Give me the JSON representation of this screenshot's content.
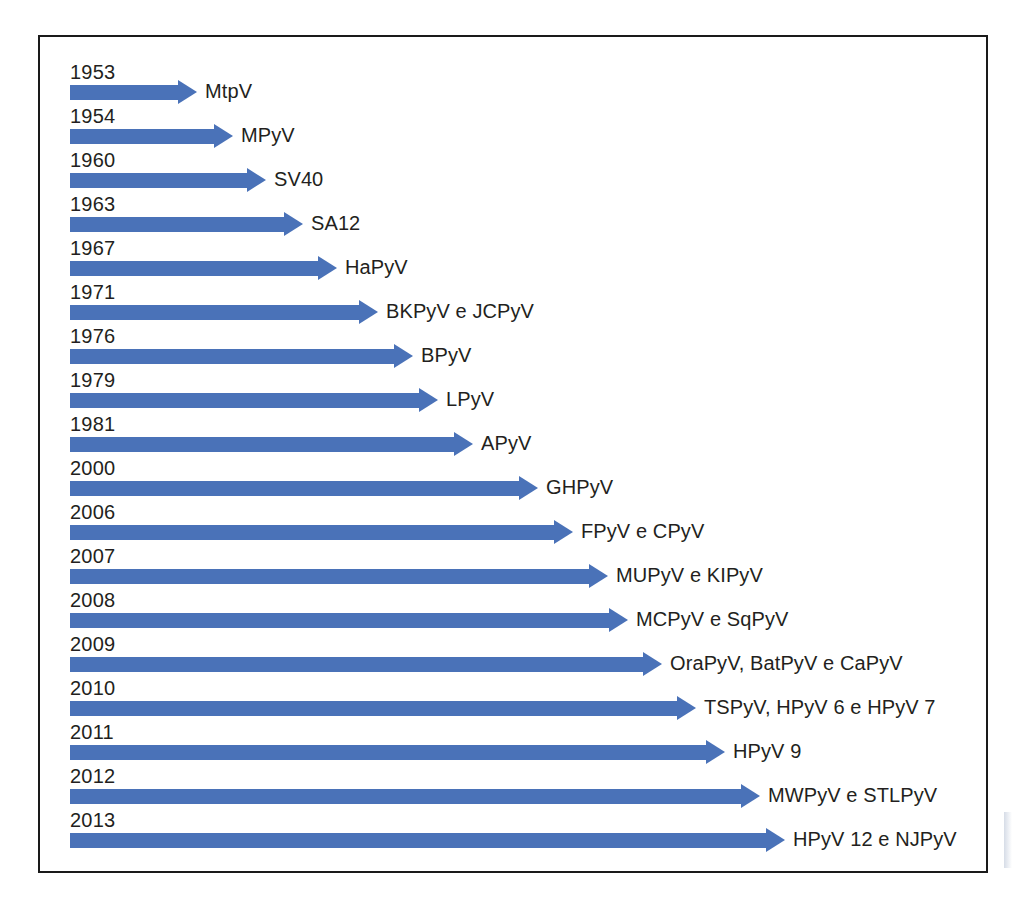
{
  "figure": {
    "kind": "timeline",
    "frame_color": "#1a1a1a",
    "arrow_color": "#4a72b8",
    "text_color": "#231f20"
  },
  "chart_data": {
    "type": "bar",
    "title": "",
    "xlabel": "",
    "ylabel": "",
    "orientation": "horizontal",
    "categories": [
      "1953",
      "1954",
      "1960",
      "1963",
      "1967",
      "1971",
      "1976",
      "1979",
      "1981",
      "2000",
      "2006",
      "2007",
      "2008",
      "2009",
      "2010",
      "2011",
      "2012",
      "2013"
    ],
    "values": [
      127,
      163,
      196,
      233,
      267,
      308,
      343,
      368,
      403,
      468,
      503,
      538,
      558,
      592,
      626,
      655,
      690,
      715
    ],
    "labels": [
      "MtpV",
      "MPyV",
      "SV40",
      "SA12",
      "HaPyV",
      "BKPyV e JCPyV",
      "BPyV",
      "LPyV",
      "APyV",
      "GHPyV",
      "FPyV e CPyV",
      "MUPyV e KIPyV",
      "MCPyV e SqPyV",
      "OraPyV, BatPyV e CaPyV",
      "TSPyV, HPyV 6 e HPyV 7",
      "HPyV 9",
      "MWPyV e STLPyV",
      "HPyV 12 e NJPyV"
    ]
  },
  "rows": [
    {
      "year": "1953",
      "label": "MtpV",
      "length": 127,
      "top": 62
    },
    {
      "year": "1954",
      "label": "MPyV",
      "length": 163,
      "top": 106
    },
    {
      "year": "1960",
      "label": "SV40",
      "length": 196,
      "top": 150
    },
    {
      "year": "1963",
      "label": "SA12",
      "length": 233,
      "top": 194
    },
    {
      "year": "1967",
      "label": "HaPyV",
      "length": 267,
      "top": 238
    },
    {
      "year": "1971",
      "label": "BKPyV e JCPyV",
      "length": 308,
      "top": 282
    },
    {
      "year": "1976",
      "label": "BPyV",
      "length": 343,
      "top": 326
    },
    {
      "year": "1979",
      "label": "LPyV",
      "length": 368,
      "top": 370
    },
    {
      "year": "1981",
      "label": "APyV",
      "length": 403,
      "top": 414
    },
    {
      "year": "2000",
      "label": "GHPyV",
      "length": 468,
      "top": 458
    },
    {
      "year": "2006",
      "label": "FPyV e CPyV",
      "length": 503,
      "top": 502
    },
    {
      "year": "2007",
      "label": "MUPyV e KIPyV",
      "length": 538,
      "top": 546
    },
    {
      "year": "2008",
      "label": "MCPyV e SqPyV",
      "length": 558,
      "top": 590
    },
    {
      "year": "2009",
      "label": "OraPyV, BatPyV e CaPyV",
      "length": 592,
      "top": 634
    },
    {
      "year": "2010",
      "label": "TSPyV, HPyV 6 e HPyV 7",
      "length": 626,
      "top": 678
    },
    {
      "year": "2011",
      "label": "HPyV 9",
      "length": 655,
      "top": 722
    },
    {
      "year": "2012",
      "label": "MWPyV e STLPyV",
      "length": 690,
      "top": 766
    },
    {
      "year": "2013",
      "label": "HPyV 12 e NJPyV",
      "length": 715,
      "top": 810
    }
  ]
}
